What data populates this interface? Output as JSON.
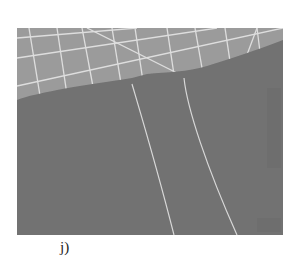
{
  "figure": {
    "panel_label": "j)",
    "colors": {
      "upper_region": "#9c9c9c",
      "lower_region": "#727272",
      "grid_lines": "#e6e6e6",
      "trace_lines": "#d8d8d8",
      "background": "#ffffff"
    }
  }
}
